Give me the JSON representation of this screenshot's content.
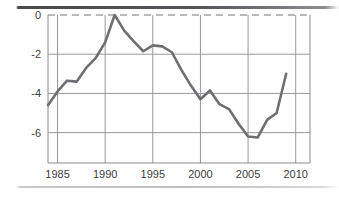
{
  "figure": {
    "background_color": "#ffffff",
    "top_rule_color": "#4a4a4a",
    "bottom_rule_color": "#c9c9cc"
  },
  "chart_data": {
    "type": "line",
    "title": "",
    "subtitle": "",
    "xlabel": "",
    "ylabel": "",
    "xlim": [
      1984,
      2011.5
    ],
    "ylim": [
      -7.55,
      0.0
    ],
    "grid": true,
    "legend_position": "none",
    "line_color": "#6e6e73",
    "line_width": 2.6,
    "zero_line_style": "dashed",
    "zero_line_color": "#757579",
    "grid_color": "#8c8c90",
    "axis_color": "#8c8c90",
    "x_tick_labels": [
      "1985",
      "1990",
      "1995",
      "2000",
      "2005",
      "2010"
    ],
    "x_ticks": [
      1985,
      1990,
      1995,
      2000,
      2005,
      2010
    ],
    "y_tick_labels": [
      "0",
      "-2",
      "-4",
      "-6"
    ],
    "y_ticks": [
      0,
      -2,
      -4,
      -6
    ],
    "series": [
      {
        "name": "value",
        "x": [
          1984,
          1985,
          1986,
          1987,
          1988,
          1989,
          1990,
          1991,
          1992,
          1993,
          1994,
          1995,
          1996,
          1997,
          1998,
          1999,
          2000,
          2001,
          2002,
          2003,
          2004,
          2005,
          2006,
          2007,
          2008,
          2009
        ],
        "values": [
          -4.6,
          -3.9,
          -3.35,
          -3.4,
          -2.7,
          -2.2,
          -1.4,
          0.0,
          -0.8,
          -1.35,
          -1.85,
          -1.55,
          -1.6,
          -1.9,
          -2.8,
          -3.6,
          -4.3,
          -3.85,
          -4.55,
          -4.8,
          -5.55,
          -6.2,
          -6.25,
          -5.35,
          -5.0,
          -3.0
        ]
      }
    ]
  }
}
